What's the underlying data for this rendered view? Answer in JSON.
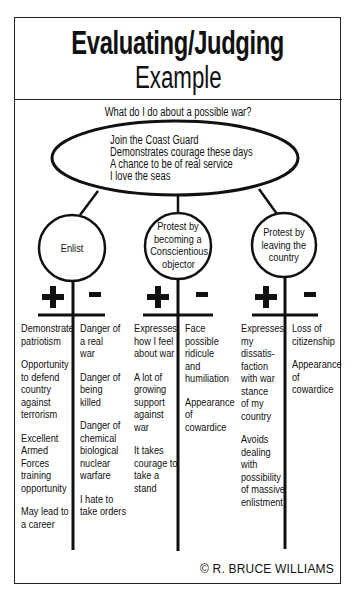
{
  "title": {
    "line1": "Evaluating/Judging",
    "line2": "Example"
  },
  "question": "What do I do about a possible war?",
  "central_idea": {
    "lines": [
      "Join the Coast Guard",
      "Demonstrates courage these days",
      "A chance to be of real service",
      "I love the seas"
    ]
  },
  "options": [
    {
      "label_lines": [
        "Enlist"
      ],
      "plus_symbol": "+",
      "minus_symbol": "-",
      "pros": [
        [
          "Demonstrate",
          "patriotism"
        ],
        [
          "Opportunity",
          "to defend",
          "country",
          "against",
          "terrorism"
        ],
        [
          "Excellent",
          "Armed",
          "Forces",
          "training",
          "opportunity"
        ],
        [
          "May lead to",
          "a career"
        ]
      ],
      "cons": [
        [
          "Danger of",
          "a real",
          "war"
        ],
        [
          "Danger of",
          "being",
          "killed"
        ],
        [
          "Danger of",
          "chemical",
          "biological",
          "nuclear",
          "warfare"
        ],
        [
          "I hate to",
          "take orders"
        ]
      ]
    },
    {
      "label_lines": [
        "Protest by",
        "becoming a",
        "Conscientious",
        "objector"
      ],
      "plus_symbol": "+",
      "minus_symbol": "-",
      "pros": [
        [
          "Expresses",
          "how I feel",
          "about war"
        ],
        [
          "A lot of",
          "growing",
          "support",
          "against",
          "war"
        ],
        [
          "It takes",
          "courage to",
          "take a",
          "stand"
        ]
      ],
      "cons": [
        [
          "Face",
          "possible",
          "ridicule",
          "and",
          "humiliation"
        ],
        [
          "Appearance",
          "of",
          "cowardice"
        ]
      ]
    },
    {
      "label_lines": [
        "Protest by",
        "leaving the",
        "country"
      ],
      "plus_symbol": "+",
      "minus_symbol": "-",
      "pros": [
        [
          "Expresses",
          "my",
          "dissatis-",
          "faction",
          "with war",
          "stance",
          "of my",
          "country"
        ],
        [
          "Avoids",
          "dealing",
          "with",
          "possibility",
          "of massive",
          "enlistment"
        ]
      ],
      "cons": [
        [
          "Loss of",
          "citizenship"
        ],
        [
          "Appearance",
          "of",
          "cowardice"
        ]
      ]
    }
  ],
  "credit": "© R. BRUCE WILLIAMS",
  "colors": {
    "ink": "#111111",
    "border": "#222222",
    "background": "#ffffff"
  }
}
